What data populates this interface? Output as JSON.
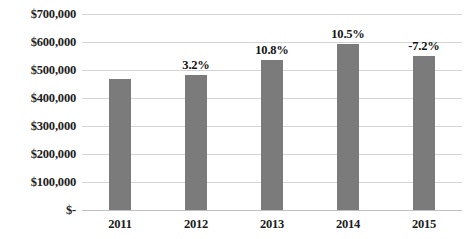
{
  "chart_data": {
    "type": "bar",
    "title": "",
    "title_cropped": true,
    "xlabel": "",
    "ylabel": "",
    "categories": [
      "2011",
      "2012",
      "2013",
      "2014",
      "2015"
    ],
    "values": [
      468000,
      483000,
      536000,
      592000,
      549000
    ],
    "series": [
      {
        "name": "Revenue",
        "values": [
          468000,
          483000,
          536000,
          592000,
          549000
        ]
      }
    ],
    "data_labels": [
      "",
      "3.2%",
      "10.8%",
      "10.5%",
      "-7.2%"
    ],
    "ylim": [
      0,
      700000
    ],
    "ytick_values": [
      700000,
      600000,
      500000,
      400000,
      300000,
      200000,
      100000,
      0
    ],
    "ytick_labels": [
      "$700,000",
      "$600,000",
      "$500,000",
      "$400,000",
      "$300,000",
      "$200,000",
      "$100,000",
      "$-"
    ],
    "grid": true,
    "grid_axis": "y",
    "legend": false,
    "legend_position": "none",
    "bar_color": "#7b7b7b",
    "gridline_color": "#d4d4d4",
    "axis_line_color": "#c0c0c0",
    "text_color": "#1c1c1c",
    "background_color": "#ffffff"
  }
}
